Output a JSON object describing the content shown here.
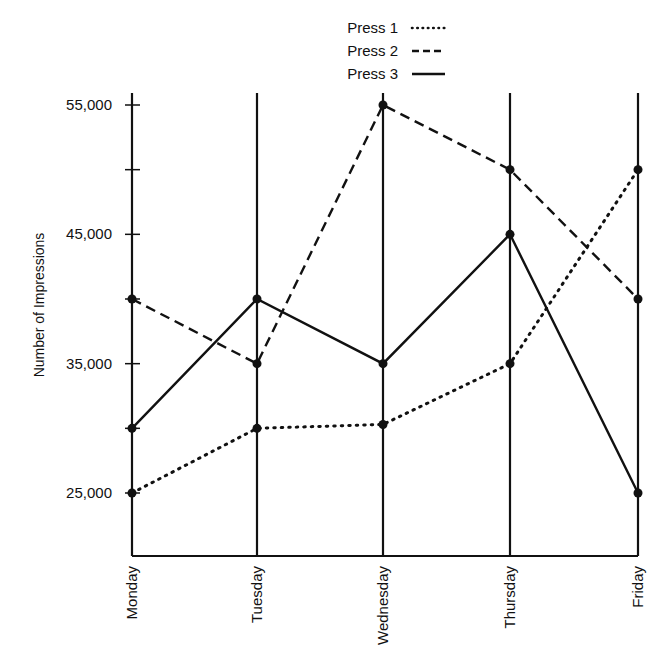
{
  "chart_data": {
    "type": "line",
    "title": "",
    "xlabel": "",
    "ylabel": "Number of Impressions",
    "categories": [
      "Monday",
      "Tuesday",
      "Wednesday",
      "Thursday",
      "Friday"
    ],
    "series": [
      {
        "name": "Press 1",
        "style": "dotted",
        "values": [
          25000,
          30000,
          30300,
          35000,
          50000
        ]
      },
      {
        "name": "Press 2",
        "style": "dashed",
        "values": [
          40000,
          35000,
          55000,
          50000,
          40000
        ]
      },
      {
        "name": "Press 3",
        "style": "solid",
        "values": [
          30000,
          40000,
          35000,
          45000,
          25000
        ]
      }
    ],
    "yticks": [
      25000,
      30000,
      35000,
      40000,
      45000,
      50000,
      55000
    ],
    "ytick_labels": [
      "25,000",
      "",
      "35,000",
      "",
      "45,000",
      "",
      "55,000"
    ],
    "ylim": [
      20000,
      56000
    ],
    "grid": false,
    "legend_position": "top-center",
    "colors": {
      "line": "#111111",
      "background": "#ffffff"
    }
  }
}
